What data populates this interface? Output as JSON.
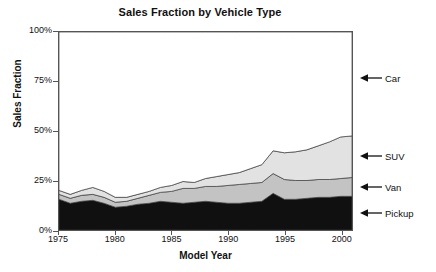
{
  "chart_data": {
    "type": "area",
    "stacked": true,
    "title": "Sales Fraction by Vehicle Type",
    "xlabel": "Model Year",
    "ylabel": "Sales Fraction",
    "xlim": [
      1975,
      2001
    ],
    "ylim": [
      0,
      100
    ],
    "yunit": "%",
    "grid": false,
    "legend_position": "right-annotations",
    "xticks": [
      1975,
      1980,
      1985,
      1990,
      1995,
      2000
    ],
    "xtick_labels": [
      "1975",
      "1980",
      "1985",
      "1990",
      "1995",
      "2000"
    ],
    "yticks": [
      0,
      25,
      50,
      75,
      100
    ],
    "ytick_labels": [
      "0%",
      "25%",
      "50%",
      "75%",
      "100%"
    ],
    "x": [
      1975,
      1976,
      1977,
      1978,
      1979,
      1980,
      1981,
      1982,
      1983,
      1984,
      1985,
      1986,
      1987,
      1988,
      1989,
      1990,
      1991,
      1992,
      1993,
      1994,
      1995,
      1996,
      1997,
      1998,
      1999,
      2000,
      2001
    ],
    "series": [
      {
        "name": "Pickup",
        "color": "#101010",
        "values": [
          15.5,
          13.5,
          14.5,
          15.0,
          13.5,
          11.5,
          12.0,
          13.0,
          13.5,
          14.5,
          14.0,
          13.5,
          14.0,
          14.5,
          14.0,
          13.5,
          13.5,
          14.0,
          14.5,
          18.5,
          15.5,
          15.5,
          16.0,
          16.5,
          16.5,
          17.0,
          17.0
        ]
      },
      {
        "name": "Van",
        "color": "#c3c3c3",
        "values": [
          2.5,
          2.5,
          3.0,
          3.0,
          3.0,
          2.5,
          2.5,
          3.0,
          4.0,
          4.5,
          5.5,
          7.5,
          7.0,
          7.5,
          8.0,
          9.0,
          9.5,
          9.5,
          9.5,
          10.0,
          10.0,
          9.5,
          9.0,
          9.0,
          9.0,
          9.0,
          9.5
        ]
      },
      {
        "name": "SUV",
        "color": "#e2e2e2",
        "values": [
          2.0,
          2.0,
          2.5,
          3.5,
          3.0,
          2.5,
          2.0,
          2.0,
          2.0,
          2.5,
          3.0,
          3.5,
          3.0,
          4.0,
          5.0,
          5.5,
          6.0,
          7.5,
          9.0,
          11.5,
          13.5,
          14.5,
          15.5,
          17.0,
          19.0,
          21.0,
          21.0
        ]
      },
      {
        "name": "Car",
        "color": "#ffffff",
        "values": [
          80.0,
          82.0,
          80.0,
          78.5,
          80.5,
          83.5,
          83.5,
          82.0,
          80.5,
          78.5,
          77.5,
          75.5,
          76.0,
          74.0,
          73.0,
          72.0,
          71.0,
          69.0,
          67.0,
          60.0,
          61.0,
          60.5,
          59.5,
          57.5,
          55.5,
          53.0,
          52.5
        ]
      }
    ],
    "annotations": [
      {
        "label": "Car",
        "y_value": 76.5,
        "icon": "left-arrow-icon"
      },
      {
        "label": "SUV",
        "y_value": 37.5,
        "icon": "left-arrow-icon"
      },
      {
        "label": "Van",
        "y_value": 22.0,
        "icon": "left-arrow-icon"
      },
      {
        "label": "Pickup",
        "y_value": 9.0,
        "icon": "left-arrow-icon"
      }
    ]
  }
}
